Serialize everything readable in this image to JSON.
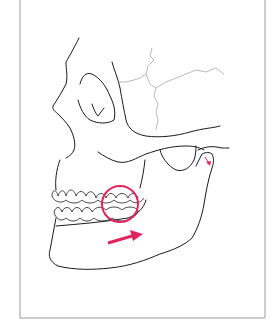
{
  "figure": {
    "annotations": [
      {
        "type": "circle",
        "target": "posterior-teeth-molars",
        "color": "#e0245e"
      },
      {
        "type": "arrow",
        "direction": "right-forward",
        "target": "mandible",
        "color": "#e0245e"
      },
      {
        "type": "arrow",
        "direction": "down",
        "target": "condyle-tmj",
        "color": "#e0245e"
      }
    ],
    "colors": {
      "line": "#1a1a1a",
      "suture": "#8a8a8a",
      "accent": "#e0245e",
      "frame": "#9a9a9a",
      "background": "#ffffff"
    }
  }
}
